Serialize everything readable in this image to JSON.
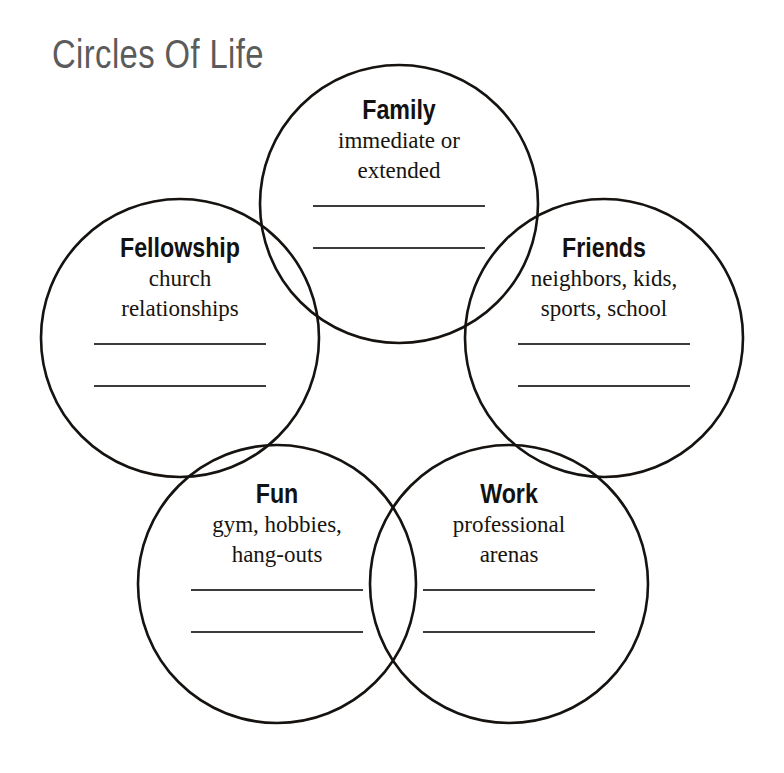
{
  "page": {
    "title": "Circles Of Life",
    "background_color": "#ffffff",
    "title_color": "#5b5b5b",
    "outline_color": "#15120f",
    "line_color": "#3b3b3b",
    "width": 784,
    "height": 773
  },
  "diagram": {
    "type": "venn-flower",
    "circle_count": 5,
    "lines_per_circle": 2,
    "circles": [
      {
        "id": "family",
        "heading": "Family",
        "description_line1": "immediate or",
        "description_line2": "extended",
        "cx": 399,
        "cy": 204,
        "r": 139
      },
      {
        "id": "fellowship",
        "heading": "Fellowship",
        "description_line1": "church",
        "description_line2": "relationships",
        "cx": 180,
        "cy": 338,
        "r": 139
      },
      {
        "id": "friends",
        "heading": "Friends",
        "description_line1": "neighbors, kids,",
        "description_line2": "sports, school",
        "cx": 604,
        "cy": 338,
        "r": 139
      },
      {
        "id": "fun",
        "heading": "Fun",
        "description_line1": "gym, hobbies,",
        "description_line2": "hang-outs",
        "cx": 277,
        "cy": 584,
        "r": 139
      },
      {
        "id": "work",
        "heading": "Work",
        "description_line1": "professional",
        "description_line2": "arenas",
        "cx": 509,
        "cy": 584,
        "r": 139
      }
    ]
  }
}
